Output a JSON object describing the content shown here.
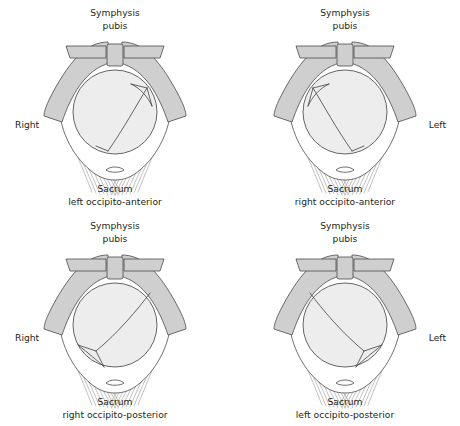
{
  "figure": {
    "colors": {
      "bone_fill": "#cfcfcf",
      "bone_stroke": "#4a4a4a",
      "head_fill": "#ededed",
      "fiber_stroke": "#8d8d8d",
      "background": "#ffffff",
      "text": "#231f20"
    }
  },
  "panels": [
    {
      "id": "top-left",
      "top_label_line1": "Symphysis",
      "top_label_line2": "pubis",
      "side_label": "Right",
      "side_label_position": "left",
      "bottom_label_line1": "Sacrum",
      "bottom_label_line2": "left occipito-anterior",
      "position_name": "left occipito-anterior",
      "abbreviation": "LOA"
    },
    {
      "id": "top-right",
      "top_label_line1": "Symphysis",
      "top_label_line2": "pubis",
      "side_label": "Left",
      "side_label_position": "right",
      "bottom_label_line1": "Sacrum",
      "bottom_label_line2": "right occipito-anterior",
      "position_name": "right occipito-anterior",
      "abbreviation": "ROA"
    },
    {
      "id": "bottom-left",
      "top_label_line1": "Symphysis",
      "top_label_line2": "pubis",
      "side_label": "Right",
      "side_label_position": "left",
      "bottom_label_line1": "Sacrum",
      "bottom_label_line2": "right occipito-posterior",
      "position_name": "right occipito-posterior",
      "abbreviation": "ROP"
    },
    {
      "id": "bottom-right",
      "top_label_line1": "Symphysis",
      "top_label_line2": "pubis",
      "side_label": "Left",
      "side_label_position": "right",
      "bottom_label_line1": "Sacrum",
      "bottom_label_line2": "left occipito-posterior",
      "position_name": "left occipito-posterior",
      "abbreviation": "LOP"
    }
  ]
}
